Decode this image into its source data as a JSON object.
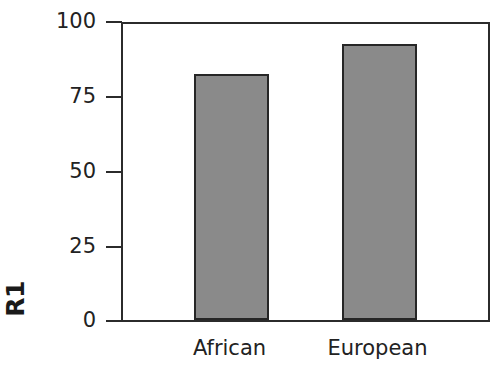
{
  "chart_data": {
    "type": "bar",
    "title": "",
    "subtitle": "",
    "xlabel": "",
    "ylabel": "R1",
    "categories": [
      "African",
      "European"
    ],
    "values": [
      82,
      92
    ],
    "series": [
      {
        "name": "R1",
        "values": [
          82,
          92
        ]
      }
    ],
    "ylim": [
      0,
      100
    ],
    "yticks": [
      0,
      25,
      50,
      75,
      100
    ],
    "ytick_labels": [
      "0",
      "25",
      "50",
      "75",
      "100"
    ],
    "grid": false,
    "legend": false,
    "legend_position": "none",
    "annotations": [],
    "bar_fill_color": "#8a8a8a",
    "bar_edge_color": "#262626",
    "axis_color": "#2b2b2b",
    "background_color": "#ffffff"
  }
}
